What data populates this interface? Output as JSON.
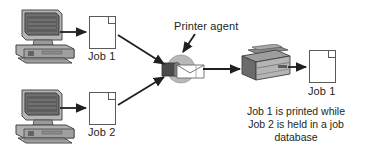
{
  "diagram": {
    "width": 366,
    "height": 156,
    "background": "#ffffff",
    "line_color": "#231f20",
    "text_color": "#231f20"
  },
  "nodes": {
    "workstation_top": {
      "name": "desktop computer",
      "icon": "computer-icon"
    },
    "workstation_bottom": {
      "name": "desktop computer",
      "icon": "computer-icon"
    },
    "job1_in_label": "Job 1",
    "job2_in_label": "Job 2",
    "agent_label": "Printer agent",
    "agent_icon": "printer-agent-icon",
    "printer_icon": "printer-icon",
    "job1_out_label": "Job 1"
  },
  "caption": {
    "line1": "Job 1 is printed while",
    "line2": "Job 2 is held in a job",
    "line3": "database"
  },
  "colors": {
    "stroke": "#231f20",
    "paper_border": "#5a5a5a",
    "device_dark": "#4d4d4d",
    "device_mid": "#8c8c8c",
    "device_light": "#c8c8c8",
    "screen": "#6e6e6e"
  }
}
